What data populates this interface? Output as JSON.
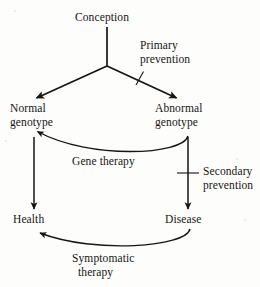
{
  "figure": {
    "type": "flow-diagram",
    "title": "",
    "background_color": "#fdfdfb",
    "ink_color": "#151515"
  },
  "nodes": {
    "conception": {
      "label": "Conception"
    },
    "normal_genotype": {
      "label_line1": "Normal",
      "label_line2": "genotype"
    },
    "abnormal_genotype": {
      "label_line1": "Abnormal",
      "label_line2": "genotype"
    },
    "health": {
      "label": "Health"
    },
    "disease": {
      "label": "Disease"
    }
  },
  "edge_labels": {
    "primary_prevention": {
      "line1": "Primary",
      "line2": "prevention"
    },
    "gene_therapy": {
      "line1": "Gene therapy"
    },
    "secondary_prevention": {
      "line1": "Secondary",
      "line2": "prevention"
    },
    "symptomatic_therapy": {
      "line1": "Symptomatic",
      "line2": "therapy"
    }
  },
  "edges": [
    {
      "name": "conception-to-split",
      "from": "conception",
      "to": "split-point",
      "style": "straight",
      "arrow": false
    },
    {
      "name": "split-to-normal-genotype",
      "from": "split-point",
      "to": "normal_genotype",
      "style": "straight",
      "arrow": true
    },
    {
      "name": "split-to-abnormal-genotype",
      "from": "split-point",
      "to": "abnormal_genotype",
      "style": "straight",
      "arrow": true,
      "blocked_by": "primary_prevention"
    },
    {
      "name": "normal-genotype-to-health",
      "from": "normal_genotype",
      "to": "health",
      "style": "straight",
      "arrow": true
    },
    {
      "name": "abnormal-genotype-to-disease",
      "from": "abnormal_genotype",
      "to": "disease",
      "style": "straight",
      "arrow": true,
      "blocked_by": "secondary_prevention"
    },
    {
      "name": "abnormal-genotype-to-normal-genotype",
      "from": "abnormal_genotype",
      "to": "normal_genotype",
      "style": "curved",
      "arrow": true,
      "label": "gene_therapy"
    },
    {
      "name": "disease-to-health",
      "from": "disease",
      "to": "health",
      "style": "curved",
      "arrow": true,
      "label": "symptomatic_therapy"
    }
  ]
}
